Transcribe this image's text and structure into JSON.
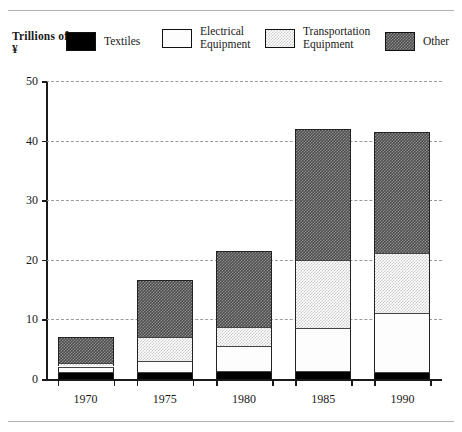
{
  "axis_title": "Trillions\nof ¥",
  "legend": [
    {
      "label": "Textiles",
      "key": "textiles",
      "swatch": "solid-black-swatch"
    },
    {
      "label": "Electrical\nEquipment",
      "key": "electrical",
      "swatch": "white-swatch"
    },
    {
      "label": "Transportation\nEquipment",
      "key": "transport",
      "swatch": "light-hatch-swatch"
    },
    {
      "label": "Other",
      "key": "other",
      "swatch": "dark-hatch-swatch"
    }
  ],
  "chart_data": {
    "type": "bar",
    "subtype": "stacked",
    "title": "",
    "xlabel": "",
    "ylabel": "Trillions of ¥",
    "ylim": [
      0,
      50
    ],
    "yticks": [
      0,
      10,
      20,
      30,
      40,
      50
    ],
    "grid": true,
    "legend_position": "top",
    "categories": [
      "1970",
      "1975",
      "1980",
      "1985",
      "1990"
    ],
    "series": [
      {
        "name": "Textiles",
        "key": "textiles",
        "values": [
          1.2,
          1.2,
          1.3,
          1.4,
          1.2
        ]
      },
      {
        "name": "Electrical Equipment",
        "key": "electrical",
        "values": [
          0.9,
          1.9,
          4.3,
          7.2,
          9.8
        ]
      },
      {
        "name": "Transportation Equipment",
        "key": "transport",
        "values": [
          0.6,
          4.0,
          3.1,
          11.4,
          10.2
        ]
      },
      {
        "name": "Other",
        "key": "other",
        "values": [
          4.3,
          9.5,
          12.8,
          22.0,
          20.3
        ]
      }
    ],
    "totals": [
      7.0,
      16.6,
      21.5,
      42.0,
      41.5
    ]
  }
}
